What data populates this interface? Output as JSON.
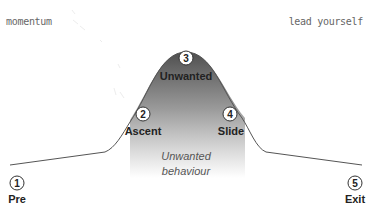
{
  "header": {
    "left_label": "momentum",
    "right_label": "lead yourself"
  },
  "diagram": {
    "caption_line1": "Unwanted",
    "caption_line2": "behaviour",
    "fill_color_top": "#5a5a5a",
    "fill_color_bottom": "#ffffff",
    "stroke_color": "#555555",
    "steps": [
      {
        "number": "1",
        "label": "Pre"
      },
      {
        "number": "2",
        "label": "Ascent"
      },
      {
        "number": "3",
        "label": "Unwanted"
      },
      {
        "number": "4",
        "label": "Slide"
      },
      {
        "number": "5",
        "label": "Exit"
      }
    ]
  }
}
